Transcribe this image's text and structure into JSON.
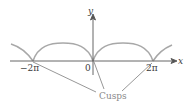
{
  "figure": {
    "axis_labels": {
      "x": "x",
      "y": "y"
    },
    "tick_labels": {
      "neg_two_pi": "−2π",
      "zero": "0",
      "two_pi": "2π"
    },
    "annotation": "Cusps",
    "colors": {
      "curve": "#a8a8a8",
      "axes": "#555555",
      "leader": "#6a6a6a"
    }
  }
}
